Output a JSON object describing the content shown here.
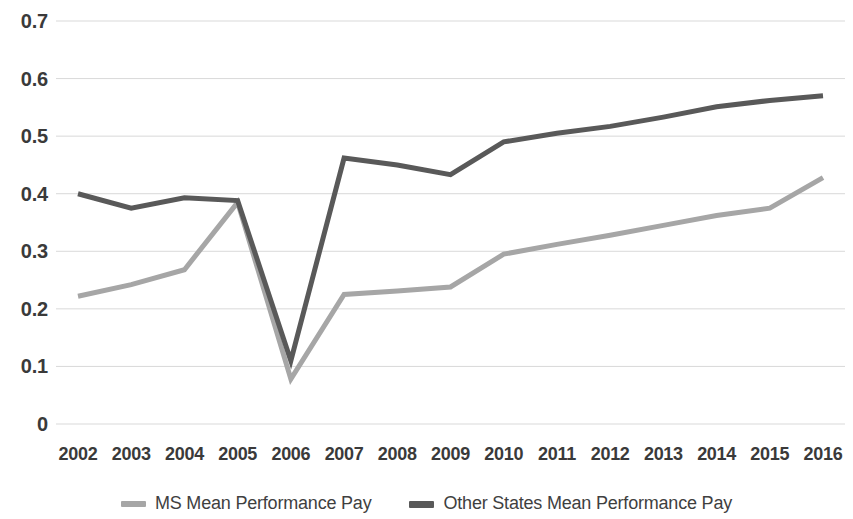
{
  "chart_data": {
    "type": "line",
    "title": "",
    "subtitle": "",
    "xlabel": "",
    "ylabel": "",
    "categories": [
      "2002",
      "2003",
      "2004",
      "2005",
      "2006",
      "2007",
      "2008",
      "2009",
      "2010",
      "2011",
      "2012",
      "2013",
      "2014",
      "2015",
      "2016"
    ],
    "series": [
      {
        "name": "MS Mean Performance Pay",
        "color": "#a6a6a6",
        "values": [
          0.222,
          0.242,
          0.268,
          0.385,
          0.078,
          0.225,
          0.231,
          0.238,
          0.295,
          0.312,
          0.328,
          0.345,
          0.362,
          0.375,
          0.428
        ]
      },
      {
        "name": "Other States Mean Performance Pay",
        "color": "#595959",
        "values": [
          0.4,
          0.375,
          0.393,
          0.388,
          0.11,
          0.462,
          0.45,
          0.433,
          0.49,
          0.505,
          0.517,
          0.533,
          0.551,
          0.562,
          0.57
        ]
      }
    ],
    "ylim": [
      0,
      0.7
    ],
    "y_ticks": [
      0,
      0.1,
      0.2,
      0.3,
      0.4,
      0.5,
      0.6,
      0.7
    ],
    "y_tick_labels": [
      "0",
      "0.1",
      "0.2",
      "0.3",
      "0.4",
      "0.5",
      "0.6",
      "0.7"
    ],
    "grid": true,
    "grid_axis": "y",
    "grid_color": "#d9d9d9",
    "legend_position": "bottom",
    "annotations": []
  },
  "legend": {
    "items": [
      {
        "label": "MS Mean Performance Pay",
        "color": "#a6a6a6"
      },
      {
        "label": "Other States Mean Performance Pay",
        "color": "#595959"
      }
    ]
  }
}
